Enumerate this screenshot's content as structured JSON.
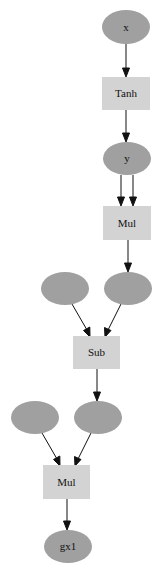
{
  "diagram": {
    "type": "computational-graph",
    "colors": {
      "variable_fill": "#a0a0a0",
      "function_fill": "#d3d3d3",
      "edge": "#111111",
      "background": "#ffffff"
    },
    "nodes": [
      {
        "id": "x",
        "kind": "variable",
        "label": "x"
      },
      {
        "id": "tanh",
        "kind": "function",
        "label": "Tanh"
      },
      {
        "id": "y",
        "kind": "variable",
        "label": "y"
      },
      {
        "id": "mul1",
        "kind": "function",
        "label": "Mul"
      },
      {
        "id": "v1",
        "kind": "variable",
        "label": ""
      },
      {
        "id": "v2",
        "kind": "variable",
        "label": ""
      },
      {
        "id": "sub",
        "kind": "function",
        "label": "Sub"
      },
      {
        "id": "v3",
        "kind": "variable",
        "label": ""
      },
      {
        "id": "v4",
        "kind": "variable",
        "label": ""
      },
      {
        "id": "mul2",
        "kind": "function",
        "label": "Mul"
      },
      {
        "id": "gx1",
        "kind": "variable",
        "label": "gx1"
      }
    ],
    "edges": [
      {
        "from": "x",
        "to": "tanh"
      },
      {
        "from": "tanh",
        "to": "y"
      },
      {
        "from": "y",
        "to": "mul1"
      },
      {
        "from": "y",
        "to": "mul1"
      },
      {
        "from": "mul1",
        "to": "v2"
      },
      {
        "from": "v1",
        "to": "sub"
      },
      {
        "from": "v2",
        "to": "sub"
      },
      {
        "from": "sub",
        "to": "v4"
      },
      {
        "from": "v3",
        "to": "mul2"
      },
      {
        "from": "v4",
        "to": "mul2"
      },
      {
        "from": "mul2",
        "to": "gx1"
      }
    ]
  }
}
